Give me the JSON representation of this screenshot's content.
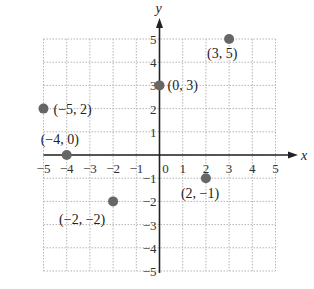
{
  "chart_data": {
    "type": "scatter",
    "title": "",
    "xlabel": "x",
    "ylabel": "y",
    "xlim": [
      -5,
      5
    ],
    "ylim": [
      -5,
      5
    ],
    "grid": true,
    "x_ticks": [
      "−5",
      "−4",
      "−3",
      "−2",
      "−1",
      "0",
      "1",
      "2",
      "3",
      "4",
      "5"
    ],
    "y_ticks": [
      "5",
      "4",
      "3",
      "2",
      "1",
      "−1",
      "−2",
      "−3",
      "−4",
      "−5"
    ],
    "points": [
      {
        "x": 3,
        "y": 5,
        "label": "(3, 5)"
      },
      {
        "x": 0,
        "y": 3,
        "label": "(0, 3)"
      },
      {
        "x": -5,
        "y": 2,
        "label": "(−5, 2)"
      },
      {
        "x": -4,
        "y": 0,
        "label": "(−4, 0)"
      },
      {
        "x": 2,
        "y": -1,
        "label": "(2, −1)"
      },
      {
        "x": -2,
        "y": -2,
        "label": "(−2, −2)"
      }
    ],
    "point_color": "#666666"
  }
}
